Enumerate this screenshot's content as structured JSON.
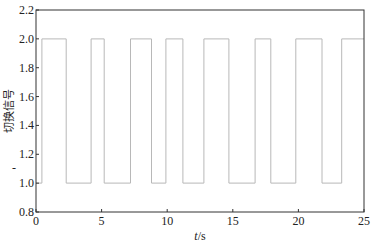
{
  "chart_data": {
    "type": "line",
    "title": "",
    "xlabel": "t/s",
    "xlabel_italic_part": "t",
    "xlabel_unit_part": "/s",
    "ylabel": "切换信号",
    "xlim": [
      0,
      25
    ],
    "ylim": [
      0.8,
      2.2
    ],
    "xticks": [
      0,
      5,
      10,
      15,
      20,
      25
    ],
    "xtick_labels": [
      "0",
      "5",
      "10",
      "15",
      "20",
      "25"
    ],
    "yticks": [
      0.8,
      1.0,
      1.2,
      1.4,
      1.6,
      1.8,
      2.0,
      2.2
    ],
    "ytick_labels": [
      "0.8",
      "1.0",
      "1.2",
      "1.4",
      "1.6",
      "1.8",
      "2.0",
      "2.2"
    ],
    "grid": false,
    "legend": null,
    "series": [
      {
        "name": "switching signal",
        "style": "step",
        "color": "#b8b8b8",
        "x": [
          0,
          0.45,
          0.45,
          2.3,
          2.3,
          4.2,
          4.2,
          5.2,
          5.2,
          7.2,
          7.2,
          8.8,
          8.8,
          9.9,
          9.9,
          11.2,
          11.2,
          12.8,
          12.8,
          14.7,
          14.7,
          16.7,
          16.7,
          17.9,
          17.9,
          19.8,
          19.8,
          21.8,
          21.8,
          23.3,
          23.3,
          25
        ],
        "y": [
          1,
          1,
          2,
          2,
          1,
          1,
          2,
          2,
          1,
          1,
          2,
          2,
          1,
          1,
          2,
          2,
          1,
          1,
          2,
          2,
          1,
          1,
          2,
          2,
          1,
          1,
          2,
          2,
          1,
          1,
          2,
          2
        ]
      }
    ]
  },
  "colors": {
    "axis": "#333333",
    "signal": "#b8b8b8",
    "background": "#ffffff"
  }
}
